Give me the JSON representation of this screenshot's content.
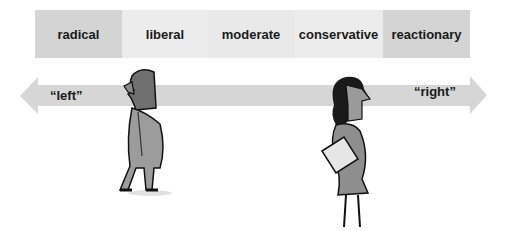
{
  "spectrum": {
    "segments": [
      {
        "label": "radical",
        "color": "#d4d4d4",
        "width": 87
      },
      {
        "label": "liberal",
        "color": "#ececec",
        "width": 86
      },
      {
        "label": "moderate",
        "color": "#e9e9e9",
        "width": 86
      },
      {
        "label": "conservative",
        "color": "#ececec",
        "width": 89
      },
      {
        "label": "reactionary",
        "color": "#d4d4d4",
        "width": 87
      }
    ]
  },
  "arrow": {
    "left_label": "“left”",
    "right_label": "“right”",
    "color": "#d6d6d6"
  },
  "figures": {
    "left": "man-walking-left",
    "right": "woman-walking-right"
  }
}
